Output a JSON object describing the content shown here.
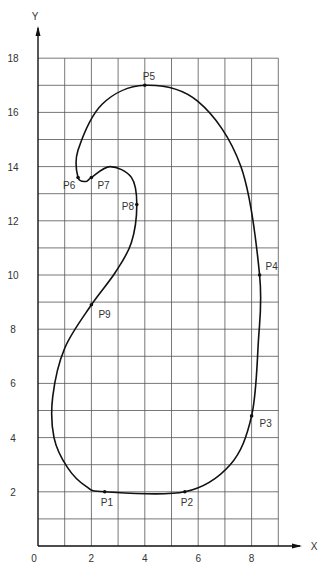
{
  "chart_data": {
    "type": "line",
    "title": "",
    "xlabel": "X",
    "ylabel": "Y",
    "xlim": [
      0,
      9
    ],
    "ylim": [
      0,
      18
    ],
    "grid": true,
    "x_ticks": [
      0,
      2,
      4,
      6,
      8
    ],
    "y_ticks": [
      2,
      4,
      6,
      8,
      10,
      12,
      14,
      16,
      18
    ],
    "closed_curve": true,
    "control_points": [
      {
        "label": "P1",
        "x": 2.5,
        "y": 2.0
      },
      {
        "label": "P2",
        "x": 5.5,
        "y": 2.0
      },
      {
        "label": "P3",
        "x": 8.0,
        "y": 4.8
      },
      {
        "label": "P4",
        "x": 8.3,
        "y": 10.0
      },
      {
        "label": "P5",
        "x": 4.0,
        "y": 17.0
      },
      {
        "label": "P6",
        "x": 1.5,
        "y": 13.6
      },
      {
        "label": "P7",
        "x": 2.0,
        "y": 13.6
      },
      {
        "label": "P8",
        "x": 3.7,
        "y": 12.6
      },
      {
        "label": "P9",
        "x": 2.0,
        "y": 8.9
      }
    ],
    "curve_path": [
      [
        2.5,
        2.0
      ],
      [
        5.5,
        2.0
      ],
      [
        7.2,
        3.0
      ],
      [
        8.0,
        4.8
      ],
      [
        8.25,
        7.5
      ],
      [
        8.3,
        10.0
      ],
      [
        7.6,
        14.0
      ],
      [
        6.0,
        16.4
      ],
      [
        4.0,
        17.0
      ],
      [
        2.4,
        16.3
      ],
      [
        1.5,
        14.6
      ],
      [
        1.5,
        13.6
      ],
      [
        1.8,
        13.45
      ],
      [
        2.0,
        13.6
      ],
      [
        2.7,
        14.0
      ],
      [
        3.5,
        13.6
      ],
      [
        3.7,
        12.6
      ],
      [
        3.5,
        11.2
      ],
      [
        2.9,
        10.1
      ],
      [
        2.0,
        8.9
      ],
      [
        1.0,
        7.3
      ],
      [
        0.55,
        5.5
      ],
      [
        0.6,
        4.0
      ],
      [
        1.1,
        2.9
      ],
      [
        1.8,
        2.2
      ],
      [
        2.5,
        2.0
      ]
    ]
  },
  "axes": {
    "x_label": "X",
    "y_label": "Y",
    "origin_label": "0"
  }
}
